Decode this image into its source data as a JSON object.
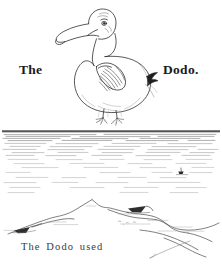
{
  "page": {
    "background_color": "#ffffff",
    "ink_color": "#1a1a1a",
    "width": 222,
    "height": 267
  },
  "illustration": {
    "subject": "dodo-bird",
    "style": "line-engraving",
    "parts": [
      "head",
      "hooked-beak",
      "eye",
      "neck",
      "body",
      "wing",
      "tail-tuft",
      "feet"
    ]
  },
  "labels": {
    "left_word": "The",
    "right_word": "Dodo."
  },
  "horizon": {
    "rule_color": "#2b2b2b",
    "y": 131
  },
  "seascape": {
    "water_texture": "horizontal-hatching",
    "boat": "distant-boat",
    "shoreline": "rocky-island-outline",
    "birds": [
      "bird-left",
      "bird-right"
    ]
  },
  "caption": {
    "text": "The Dodo used"
  }
}
